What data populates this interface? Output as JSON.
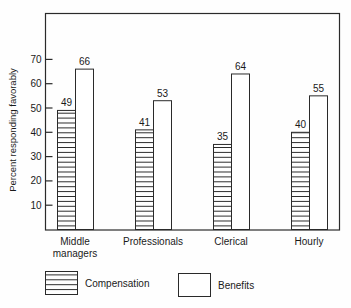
{
  "chart_data": {
    "type": "bar",
    "title": "",
    "xlabel": "",
    "ylabel": "Percent responding favorably",
    "ylim": [
      0,
      80
    ],
    "yticks": [
      10,
      20,
      30,
      40,
      50,
      60,
      70
    ],
    "grid": false,
    "legend_position": "bottom",
    "categories": [
      "Middle managers",
      "Professionals",
      "Clerical",
      "Hourly"
    ],
    "category_lines": [
      [
        "Middle",
        "managers"
      ],
      [
        "Professionals"
      ],
      [
        "Clerical"
      ],
      [
        "Hourly"
      ]
    ],
    "series": [
      {
        "name": "Compensation",
        "pattern": "horizontal-hatch",
        "values": [
          49,
          41,
          35,
          40
        ]
      },
      {
        "name": "Benefits",
        "pattern": "open",
        "values": [
          66,
          53,
          64,
          55
        ]
      }
    ]
  },
  "legend": {
    "compensation_label": "Compensation",
    "benefits_label": "Benefits"
  }
}
